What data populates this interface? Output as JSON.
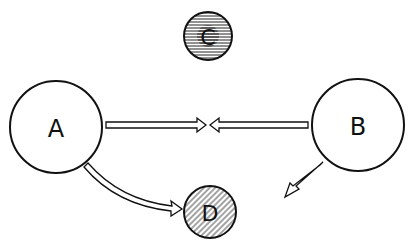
{
  "diagram": {
    "nodes": [
      {
        "id": "A",
        "label": "A",
        "fill": "plain"
      },
      {
        "id": "B",
        "label": "B",
        "fill": "plain"
      },
      {
        "id": "C",
        "label": "C",
        "fill": "horizontal-hatch"
      },
      {
        "id": "D",
        "label": "D",
        "fill": "diagonal-hatch"
      }
    ],
    "edges": [
      {
        "from": "A",
        "to": "midpoint",
        "style": "hollow-arrow"
      },
      {
        "from": "B",
        "to": "midpoint",
        "style": "hollow-arrow"
      },
      {
        "from": "A",
        "to": "D",
        "style": "hollow-curved-arrow"
      },
      {
        "from": "B",
        "to": "D",
        "style": "hollow-arrow"
      }
    ],
    "colors": {
      "stroke": "#111111",
      "background": "#ffffff"
    }
  }
}
